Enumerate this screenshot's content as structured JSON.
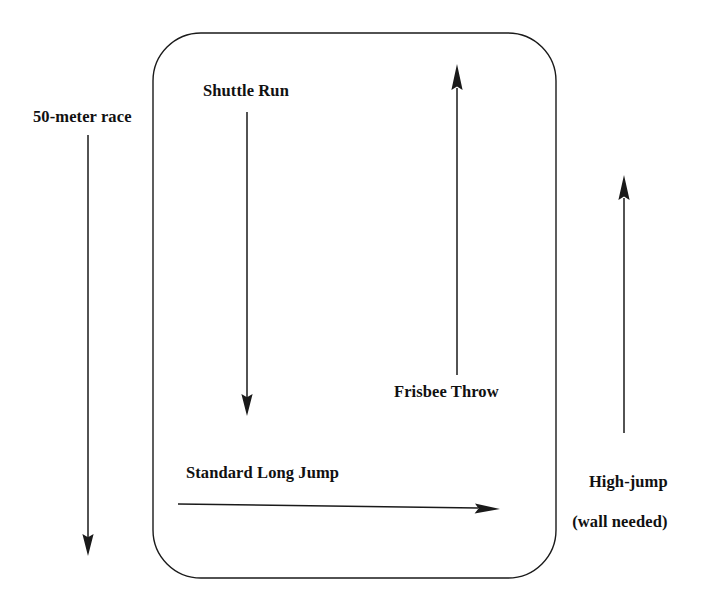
{
  "diagram": {
    "type": "annotated-area-diagram",
    "title": "",
    "background_color": "#ffffff",
    "stroke_color": "#1a1a1a",
    "text_color": "#111111",
    "boundary": {
      "name": "rounded-rectangle-area",
      "shape": "rounded-rectangle",
      "x": 153,
      "y": 33,
      "width": 403,
      "height": 545,
      "corner_radius": 48,
      "stroke_width": 1.4,
      "fill": "none"
    },
    "labels": [
      {
        "id": "50-meter-race",
        "text": "50-meter race",
        "x": 33,
        "y": 107
      },
      {
        "id": "shuttle-run",
        "text": "Shuttle Run",
        "x": 203,
        "y": 81
      },
      {
        "id": "frisbee-throw",
        "text": "Frisbee Throw",
        "x": 394,
        "y": 382
      },
      {
        "id": "standard-long-jump",
        "text": "Standard Long Jump",
        "x": 186,
        "y": 463
      },
      {
        "id": "high-jump-line1",
        "text": "High-jump",
        "x": 572,
        "y": 452
      },
      {
        "id": "high-jump-line2",
        "text": "(wall needed)",
        "x": 572,
        "y": 472
      }
    ],
    "high_jump_label": {
      "line1": "High-jump",
      "line2": "(wall needed)"
    },
    "arrows": [
      {
        "id": "arrow-50-meter-race",
        "label": "50-meter race",
        "orientation": "vertical",
        "direction": "down",
        "x1": 88,
        "y1": 135,
        "x2": 88,
        "y2": 553,
        "length_px": 418
      },
      {
        "id": "arrow-shuttle-run",
        "label": "Shuttle Run",
        "orientation": "vertical",
        "direction": "down",
        "x1": 247,
        "y1": 112,
        "x2": 247,
        "y2": 413,
        "length_px": 301
      },
      {
        "id": "arrow-frisbee-throw",
        "label": "Frisbee Throw",
        "orientation": "vertical",
        "direction": "up",
        "x1": 457,
        "y1": 375,
        "x2": 457,
        "y2": 67,
        "length_px": 308
      },
      {
        "id": "arrow-high-jump",
        "label": "High-jump (wall needed)",
        "orientation": "vertical",
        "direction": "up",
        "x1": 624,
        "y1": 433,
        "x2": 624,
        "y2": 178,
        "length_px": 255
      },
      {
        "id": "arrow-standard-long-jump",
        "label": "Standard Long Jump",
        "orientation": "horizontal",
        "direction": "right",
        "x1": 178,
        "y1": 506,
        "x2": 498,
        "y2": 506,
        "length_px": 320
      }
    ]
  }
}
